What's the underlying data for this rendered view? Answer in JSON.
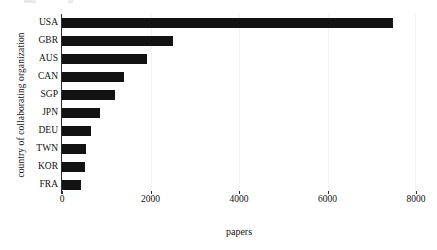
{
  "chart_data": {
    "type": "bar",
    "orientation": "horizontal",
    "title": "",
    "xlabel": "papers",
    "ylabel": "country of collaborating organization",
    "categories": [
      "USA",
      "GBR",
      "AUS",
      "CAN",
      "SGP",
      "JPN",
      "DEU",
      "TWN",
      "KOR",
      "FRA"
    ],
    "values": [
      7480,
      2510,
      1920,
      1400,
      1200,
      860,
      660,
      550,
      520,
      430
    ],
    "xlim": [
      0,
      8000
    ],
    "xticks": [
      0,
      2000,
      4000,
      6000,
      8000
    ],
    "xtick_labels": [
      "0",
      "2000",
      "4000",
      "6000",
      "8000"
    ],
    "grid": true,
    "legend": null,
    "bar_color": "#121212",
    "background_color": "#ffffff",
    "axis_color": "#2b2b2b",
    "gridline_color": "#f2f2f2"
  }
}
